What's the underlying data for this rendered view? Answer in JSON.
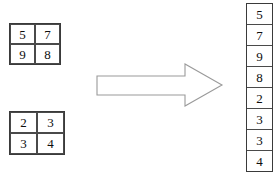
{
  "diagram": {
    "background_color": "#ffffff",
    "stroke_color": "#3a3a3a",
    "arrow_color": "#9a9a9a",
    "text_color": "#0d0d0d"
  },
  "matrix_top": {
    "name": "top-left 2x2 matrix",
    "rows": 2,
    "cols": 2,
    "cells": [
      "5",
      "7",
      "9",
      "8"
    ]
  },
  "matrix_bottom": {
    "name": "bottom-left 2x2 matrix",
    "rows": 2,
    "cols": 2,
    "cells": [
      "2",
      "3",
      "3",
      "4"
    ]
  },
  "arrow": {
    "icon": "right-arrow-outline-icon",
    "direction": "right",
    "filled": false
  },
  "vector": {
    "name": "output column vector",
    "length": 8,
    "cells": [
      "5",
      "7",
      "9",
      "8",
      "2",
      "3",
      "3",
      "4"
    ]
  }
}
